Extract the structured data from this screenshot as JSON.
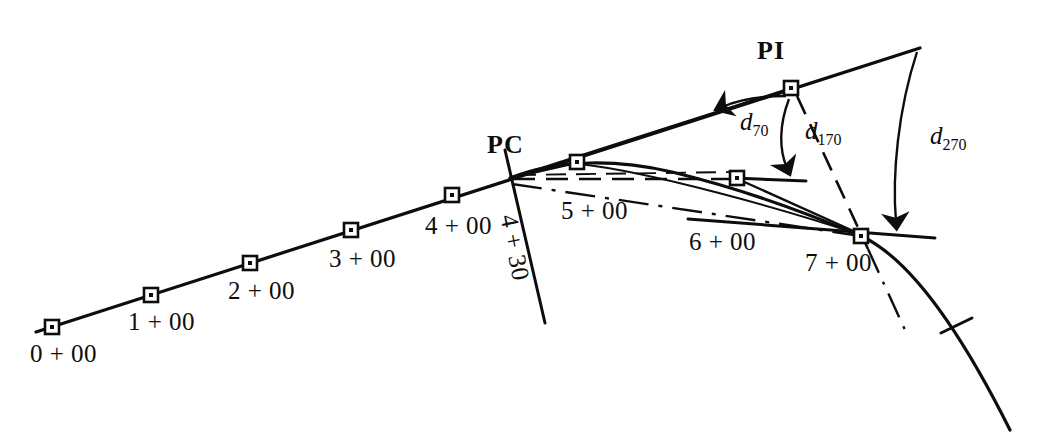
{
  "figure": {
    "type": "surveying-horizontal-curve-diagram",
    "background_color": "#ffffff",
    "ink_color": "#0d0d0d",
    "width": 1054,
    "height": 444
  },
  "stations": [
    {
      "id": "sta-0-00",
      "label": "0 + 00",
      "x": 52,
      "y": 327,
      "label_x": 30,
      "label_y": 340
    },
    {
      "id": "sta-1-00",
      "label": "1 + 00",
      "x": 151,
      "y": 295,
      "label_x": 128,
      "label_y": 308
    },
    {
      "id": "sta-2-00",
      "label": "2 + 00",
      "x": 250,
      "y": 263,
      "label_x": 228,
      "label_y": 277
    },
    {
      "id": "sta-3-00",
      "label": "3 + 00",
      "x": 351,
      "y": 230,
      "label_x": 329,
      "label_y": 245
    },
    {
      "id": "sta-4-00",
      "label": "4 + 00",
      "x": 452,
      "y": 195,
      "label_x": 425,
      "label_y": 212
    },
    {
      "id": "sta-5-00",
      "label": "5 + 00",
      "x": 577,
      "y": 162,
      "label_x": 561,
      "label_y": 197
    },
    {
      "id": "sta-6-00",
      "label": "6 + 00",
      "x": 737,
      "y": 178,
      "label_x": 689,
      "label_y": 228
    },
    {
      "id": "sta-7-00",
      "label": "7 + 00",
      "x": 861,
      "y": 236,
      "label_x": 805,
      "label_y": 249
    }
  ],
  "radial_station": {
    "id": "sta-4-30",
    "label": "4 + 30",
    "label_x": 522,
    "label_y": 212,
    "rotation_deg": 79
  },
  "control_points": [
    {
      "id": "pc",
      "label": "PC",
      "x": 510,
      "y": 178,
      "label_x": 487,
      "label_y": 130
    },
    {
      "id": "pi",
      "label": "PI",
      "x": 791,
      "y": 88,
      "label_x": 757,
      "label_y": 36
    }
  ],
  "deflection_angles": [
    {
      "id": "d70",
      "base": "d",
      "sub": "70",
      "label_x": 740,
      "label_y": 108
    },
    {
      "id": "d170",
      "base": "d",
      "sub": "170",
      "label_x": 805,
      "label_y": 117
    },
    {
      "id": "d270",
      "base": "d",
      "sub": "270",
      "label_x": 930,
      "label_y": 122
    }
  ],
  "geometry": {
    "back_tangent_start": [
      36,
      332
    ],
    "back_tangent_end": [
      920,
      48
    ],
    "forward_tangent_start": [
      688,
      219
    ],
    "forward_tangent_end": [
      935,
      238
    ],
    "curve_end": [
      1010,
      430
    ],
    "tick_mark": [
      957,
      328
    ],
    "pc_radial_end": [
      545,
      323
    ],
    "tangent_at_600_end": [
      805,
      180
    ]
  }
}
